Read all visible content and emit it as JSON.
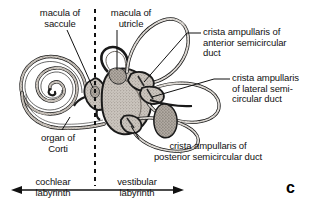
{
  "figure": {
    "panel_letter": "c"
  },
  "labels": {
    "macula_of_saccule": "macula of\nsaccule",
    "macula_of_utricle": "macula of\nutricle",
    "crista_anterior": "crista ampullaris of\nanterior semicircular\nduct",
    "crista_lateral": "crista ampullaris\nof lateral semi-\ncircular duct",
    "crista_posterior": "crista ampullaris of\nposterior semicircular duct",
    "organ_of_corti": "organ of\nCorti",
    "cochlear_labyrinth": "cochlear\nlabyrinth",
    "vestibular_labyrinth": "vestibular\nlabyrinth"
  },
  "colors": {
    "ink": "#111111",
    "outline": "#1a1a1a",
    "fill_light": "#d8d4cf",
    "fill_mid": "#b9b3ad",
    "fill_dark": "#9a938c",
    "background": "#ffffff"
  },
  "axis": {
    "divider_style": "dashed-vertical",
    "arrow_left_label": "cochlear labyrinth",
    "arrow_right_label": "vestibular labyrinth"
  }
}
